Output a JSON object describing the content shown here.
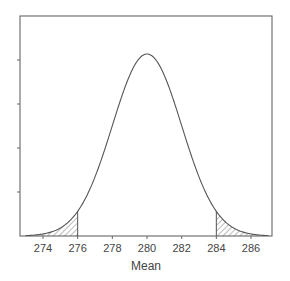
{
  "chart_data": {
    "type": "line",
    "title": "",
    "xlabel": "Mean",
    "ylabel": "",
    "xlim": [
      273,
      287
    ],
    "x_ticks": [
      274,
      276,
      278,
      280,
      282,
      284,
      286
    ],
    "y_ticks_count": 4,
    "y_tick_labels": [],
    "grid": false,
    "legend": null,
    "series": [
      {
        "name": "Normal density of sample mean",
        "distribution": "normal",
        "mean": 280,
        "sd": 2,
        "x": [
          273,
          274,
          275,
          276,
          277,
          278,
          279,
          280,
          281,
          282,
          283,
          284,
          285,
          286,
          287
        ],
        "relative_height": [
          0.002,
          0.011,
          0.044,
          0.135,
          0.325,
          0.607,
          0.882,
          1.0,
          0.882,
          0.607,
          0.325,
          0.135,
          0.044,
          0.011,
          0.002
        ]
      }
    ],
    "shaded_regions": [
      {
        "from": 273,
        "to": 276,
        "pattern": "hatched",
        "label": "lower tail"
      },
      {
        "from": 284,
        "to": 287,
        "pattern": "hatched",
        "label": "upper tail"
      }
    ],
    "critical_values": [
      276,
      284
    ]
  }
}
